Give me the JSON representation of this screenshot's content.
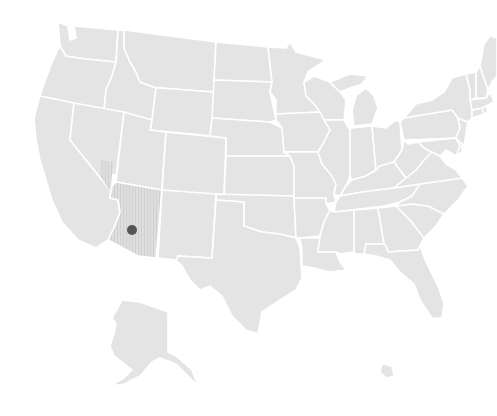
{
  "map": {
    "title": "",
    "colors": {
      "background": "#ffffff",
      "state_fill": "#e4e4e4",
      "state_border": "#ffffff",
      "highlight_fill": "#d8d8d8",
      "marker": "#555555"
    },
    "highlighted_state": "Arizona",
    "marker": {
      "label": "",
      "x": 132,
      "y": 230,
      "r": 5
    }
  }
}
